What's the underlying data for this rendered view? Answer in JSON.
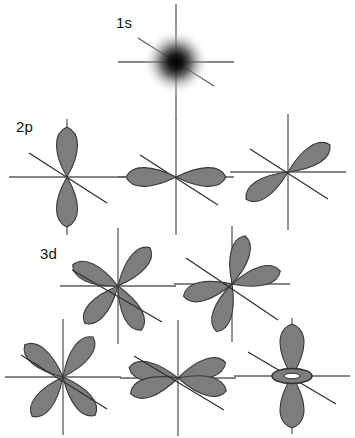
{
  "figure": {
    "title_shown": false,
    "background_color": "#ffffff",
    "lobe_fill_color": "#7d7d7d",
    "lobe_stroke_color": "#3a3a3a",
    "axis_color": "#5c5c5c",
    "label_color": "#141414",
    "width": 355,
    "height": 438
  },
  "labels": [
    {
      "text": "1s",
      "x": 116,
      "y": 14
    },
    {
      "text": "2p",
      "x": 16,
      "y": 118
    },
    {
      "text": "3d",
      "x": 40,
      "y": 245
    }
  ],
  "orbitals": [
    {
      "name": "1s",
      "shell": "1s",
      "kind": "sphere",
      "center_x": 176,
      "center_y": 62,
      "radius": 32,
      "axes": [
        "vertical",
        "horizontal",
        "diagonal"
      ]
    },
    {
      "name": "2pz",
      "shell": "2p",
      "kind": "two-lobe",
      "center_x": 67,
      "center_y": 177,
      "orientation_deg": 90,
      "axes": [
        "vertical",
        "horizontal",
        "diagonal"
      ]
    },
    {
      "name": "2px",
      "shell": "2p",
      "kind": "two-lobe",
      "center_x": 176,
      "center_y": 177,
      "orientation_deg": 0,
      "axes": [
        "vertical",
        "horizontal",
        "diagonal"
      ]
    },
    {
      "name": "2py",
      "shell": "2p",
      "kind": "two-lobe",
      "center_x": 288,
      "center_y": 172,
      "orientation_deg": 145,
      "axes": [
        "vertical",
        "horizontal",
        "diagonal"
      ]
    },
    {
      "name": "3d-a",
      "shell": "3d",
      "kind": "four-lobe",
      "center_x": 118,
      "center_y": 286,
      "lobe_angles_deg": [
        118,
        48,
        205,
        310
      ],
      "axes": [
        "vertical",
        "horizontal",
        "diagonal"
      ]
    },
    {
      "name": "3d-b",
      "shell": "3d",
      "kind": "four-lobe",
      "center_x": 232,
      "center_y": 284,
      "lobe_angles_deg": [
        162,
        72,
        250,
        340
      ],
      "axes": [
        "vertical",
        "horizontal",
        "diagonal"
      ]
    },
    {
      "name": "3d-c",
      "shell": "3d",
      "kind": "four-lobe",
      "center_x": 63,
      "center_y": 377,
      "lobe_angles_deg": [
        130,
        50,
        230,
        310
      ],
      "axes": [
        "vertical",
        "horizontal",
        "diagonal"
      ]
    },
    {
      "name": "3d-d",
      "shell": "3d",
      "kind": "four-lobe",
      "center_x": 178,
      "center_y": 378,
      "lobe_angles_deg": [
        167,
        150,
        345,
        330
      ],
      "axes": [
        "vertical",
        "horizontal",
        "diagonal"
      ]
    },
    {
      "name": "3dz2",
      "shell": "3d",
      "kind": "two-lobe-torus",
      "center_x": 292,
      "center_y": 376,
      "orientation_deg": 90,
      "axes": [
        "vertical",
        "horizontal",
        "diagonal"
      ]
    }
  ]
}
